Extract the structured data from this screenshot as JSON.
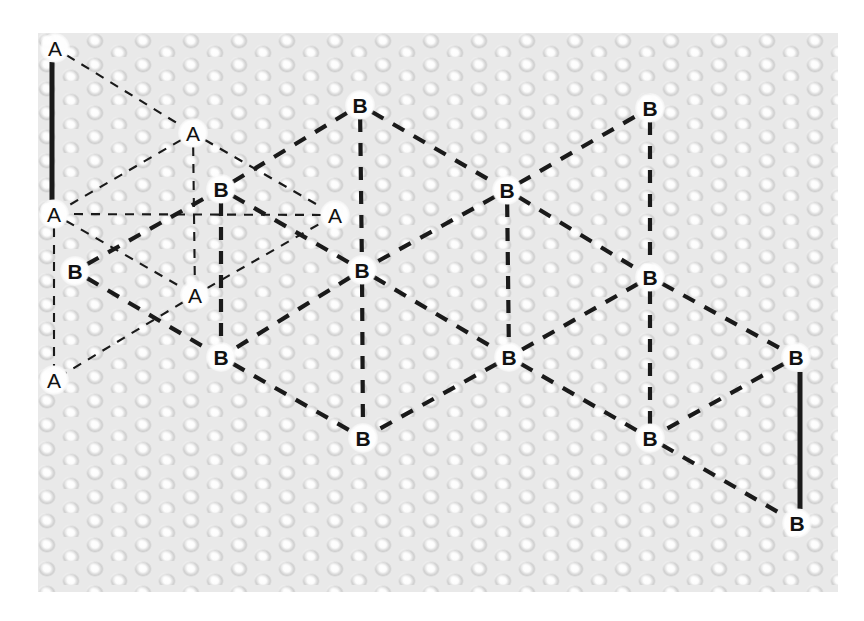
{
  "figure": {
    "background_color": "#e9e9e9",
    "stud_color": "#ffffff",
    "line_color": "#1a1a1a",
    "canvas": {
      "width": 864,
      "height": 621
    },
    "plate": {
      "x": 38,
      "y": 33,
      "width": 800,
      "height": 559
    }
  },
  "legend": {
    "site_types": [
      "A",
      "B"
    ],
    "a_style": "thin regular letter, thin dashed bonds",
    "b_style": "bold letter, thick dashed bonds",
    "solid_marker": "solid vertical reference bar"
  },
  "nodes": [
    {
      "id": "A1",
      "label": "A",
      "type": "A",
      "x": 55,
      "y": 48
    },
    {
      "id": "A2",
      "label": "A",
      "type": "A",
      "x": 193,
      "y": 133
    },
    {
      "id": "A3",
      "label": "A",
      "type": "A",
      "x": 54,
      "y": 214
    },
    {
      "id": "A4",
      "label": "A",
      "type": "A",
      "x": 335,
      "y": 215
    },
    {
      "id": "A5",
      "label": "A",
      "type": "A",
      "x": 195,
      "y": 295
    },
    {
      "id": "A6",
      "label": "A",
      "type": "A",
      "x": 54,
      "y": 380
    },
    {
      "id": "B1",
      "label": "B",
      "type": "B",
      "x": 221,
      "y": 189
    },
    {
      "id": "B2",
      "label": "B",
      "type": "B",
      "x": 360,
      "y": 105
    },
    {
      "id": "B3",
      "label": "B",
      "type": "B",
      "x": 507,
      "y": 190
    },
    {
      "id": "B4",
      "label": "B",
      "type": "B",
      "x": 650,
      "y": 108
    },
    {
      "id": "B5",
      "label": "B",
      "type": "B",
      "x": 75,
      "y": 271
    },
    {
      "id": "B6",
      "label": "B",
      "type": "B",
      "x": 362,
      "y": 270
    },
    {
      "id": "B7",
      "label": "B",
      "type": "B",
      "x": 650,
      "y": 277
    },
    {
      "id": "B8",
      "label": "B",
      "type": "B",
      "x": 221,
      "y": 357
    },
    {
      "id": "B9",
      "label": "B",
      "type": "B",
      "x": 509,
      "y": 357
    },
    {
      "id": "B10",
      "label": "B",
      "type": "B",
      "x": 796,
      "y": 357
    },
    {
      "id": "B11",
      "label": "B",
      "type": "B",
      "x": 363,
      "y": 438
    },
    {
      "id": "B12",
      "label": "B",
      "type": "B",
      "x": 650,
      "y": 438
    },
    {
      "id": "B13",
      "label": "B",
      "type": "B",
      "x": 797,
      "y": 523
    }
  ],
  "edges_thin": [
    {
      "from": "A1",
      "to": "A2"
    },
    {
      "from": "A2",
      "to": "A5"
    },
    {
      "from": "A2",
      "to": "A3"
    },
    {
      "from": "A3",
      "to": "A5"
    },
    {
      "from": "A3",
      "to": "A6"
    },
    {
      "from": "A5",
      "to": "A6"
    },
    {
      "from": "A2",
      "to": "A4"
    },
    {
      "from": "A5",
      "to": "A4"
    },
    {
      "from": "A4",
      "to": "A3"
    }
  ],
  "edges_thick": [
    {
      "from": "B5",
      "to": "B1"
    },
    {
      "from": "B5",
      "to": "B8"
    },
    {
      "from": "B1",
      "to": "B8"
    },
    {
      "from": "B1",
      "to": "B2"
    },
    {
      "from": "B1",
      "to": "B6"
    },
    {
      "from": "B2",
      "to": "B6"
    },
    {
      "from": "B6",
      "to": "B8"
    },
    {
      "from": "B6",
      "to": "B11"
    },
    {
      "from": "B8",
      "to": "B11"
    },
    {
      "from": "B2",
      "to": "B3"
    },
    {
      "from": "B3",
      "to": "B6"
    },
    {
      "from": "B3",
      "to": "B9"
    },
    {
      "from": "B6",
      "to": "B9"
    },
    {
      "from": "B9",
      "to": "B11"
    },
    {
      "from": "B3",
      "to": "B4"
    },
    {
      "from": "B4",
      "to": "B7"
    },
    {
      "from": "B3",
      "to": "B7"
    },
    {
      "from": "B7",
      "to": "B9"
    },
    {
      "from": "B7",
      "to": "B10"
    },
    {
      "from": "B9",
      "to": "B12"
    },
    {
      "from": "B7",
      "to": "B12"
    },
    {
      "from": "B10",
      "to": "B12"
    },
    {
      "from": "B12",
      "to": "B13"
    }
  ],
  "solid_bars": [
    {
      "id": "bar-left",
      "x1": 52,
      "y1": 62,
      "x2": 52,
      "y2": 200,
      "width": 5
    },
    {
      "id": "bar-right",
      "x1": 800,
      "y1": 372,
      "x2": 800,
      "y2": 509,
      "width": 5
    }
  ],
  "chart_data": {
    "type": "scatter",
    "xlabel": "",
    "ylabel": "",
    "series": [
      {
        "name": "A",
        "marker": "letter A (regular weight)",
        "points": [
          [
            55,
            48
          ],
          [
            193,
            133
          ],
          [
            54,
            214
          ],
          [
            335,
            215
          ],
          [
            195,
            295
          ],
          [
            54,
            380
          ]
        ]
      },
      {
        "name": "B",
        "marker": "letter B (bold weight)",
        "points": [
          [
            221,
            189
          ],
          [
            360,
            105
          ],
          [
            507,
            190
          ],
          [
            650,
            108
          ],
          [
            75,
            271
          ],
          [
            362,
            270
          ],
          [
            650,
            277
          ],
          [
            221,
            357
          ],
          [
            509,
            357
          ],
          [
            796,
            357
          ],
          [
            363,
            438
          ],
          [
            650,
            438
          ],
          [
            797,
            523
          ]
        ]
      }
    ],
    "annotations": [
      "Thin dashed bonds connect A sites in a triangular sublattice",
      "Thick dashed bonds connect B sites in a triangular sublattice",
      "Two solid vertical bars mark reference lengths at left and right"
    ],
    "grid": false,
    "legend_position": "none"
  }
}
